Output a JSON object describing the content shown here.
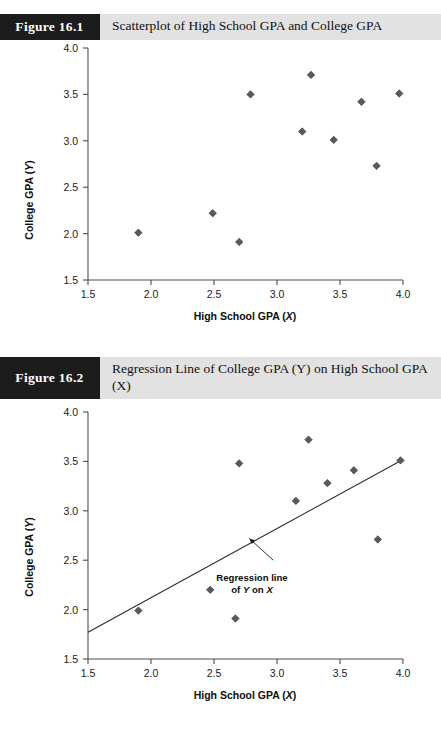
{
  "page": {
    "background": "#ffffff",
    "accent_badge_color": "#1c1c1c",
    "banner_color": "#e2e2e2",
    "marker_color": "#5a5a5a",
    "line_color": "#2a2a2a"
  },
  "figures": [
    {
      "id": "figure-16-1",
      "label": "Figure 16.1",
      "caption": "Scatterplot of High School GPA and College GPA"
    },
    {
      "id": "figure-16-2",
      "label": "Figure 16.2",
      "caption": "Regression Line of College GPA (Y) on High School GPA (X)"
    }
  ],
  "chart_data": [
    {
      "type": "scatter",
      "title": "Scatterplot of High School GPA and College GPA",
      "xlabel": "High School GPA (X)",
      "xlabel_main": "High School GPA (",
      "xlabel_italic": "X",
      "xlabel_tail": ")",
      "ylabel": "College GPA (Y)",
      "ylabel_main": "College GPA (",
      "ylabel_italic": "Y",
      "ylabel_tail": ")",
      "xlim": [
        1.5,
        4.0
      ],
      "ylim": [
        1.5,
        4.0
      ],
      "xticks": [
        "1.5",
        "2.0",
        "2.5",
        "3.0",
        "3.5",
        "4.0"
      ],
      "xtick_values": [
        1.5,
        2.0,
        2.5,
        3.0,
        3.5,
        4.0
      ],
      "yticks": [
        "1.5",
        "2.0",
        "2.5",
        "3.0",
        "3.5",
        "4.0"
      ],
      "ytick_values": [
        1.5,
        2.0,
        2.5,
        3.0,
        3.5,
        4.0
      ],
      "grid": false,
      "legend": false,
      "points": [
        {
          "x": 1.9,
          "y": 2.01
        },
        {
          "x": 2.49,
          "y": 2.22
        },
        {
          "x": 2.7,
          "y": 1.91
        },
        {
          "x": 2.79,
          "y": 3.5
        },
        {
          "x": 3.2,
          "y": 3.1
        },
        {
          "x": 3.27,
          "y": 3.71
        },
        {
          "x": 3.45,
          "y": 3.01
        },
        {
          "x": 3.67,
          "y": 3.42
        },
        {
          "x": 3.79,
          "y": 2.73
        },
        {
          "x": 3.97,
          "y": 3.51
        }
      ]
    },
    {
      "type": "scatter",
      "title": "Regression Line of College GPA (Y) on High School GPA (X)",
      "xlabel": "High School GPA (X)",
      "xlabel_main": "High School GPA (",
      "xlabel_italic": "X",
      "xlabel_tail": ")",
      "ylabel": "College GPA (Y)",
      "ylabel_main": "College GPA (",
      "ylabel_italic": "Y",
      "ylabel_tail": ")",
      "xlim": [
        1.5,
        4.0
      ],
      "ylim": [
        1.5,
        4.0
      ],
      "xticks": [
        "1.5",
        "2.0",
        "2.5",
        "3.0",
        "3.5",
        "4.0"
      ],
      "xtick_values": [
        1.5,
        2.0,
        2.5,
        3.0,
        3.5,
        4.0
      ],
      "yticks": [
        "1.5",
        "2.0",
        "2.5",
        "3.0",
        "3.5",
        "4.0"
      ],
      "ytick_values": [
        1.5,
        2.0,
        2.5,
        3.0,
        3.5,
        4.0
      ],
      "grid": false,
      "legend": false,
      "points": [
        {
          "x": 1.9,
          "y": 1.99
        },
        {
          "x": 2.47,
          "y": 2.2
        },
        {
          "x": 2.67,
          "y": 1.91
        },
        {
          "x": 2.7,
          "y": 3.48
        },
        {
          "x": 3.15,
          "y": 3.1
        },
        {
          "x": 3.25,
          "y": 3.72
        },
        {
          "x": 3.4,
          "y": 3.28
        },
        {
          "x": 3.61,
          "y": 3.41
        },
        {
          "x": 3.8,
          "y": 2.71
        },
        {
          "x": 3.98,
          "y": 3.51
        }
      ],
      "fit_line": {
        "x_start": 1.5,
        "y_start": 1.77,
        "x_end": 4.0,
        "y_end": 3.52
      },
      "annotation": {
        "line1": "Regression line",
        "line2_prefix": "of ",
        "line2_y": "Y",
        "line2_mid": " on ",
        "line2_x": "X",
        "arrow_tip": {
          "x": 2.78,
          "y": 2.72
        },
        "arrow_tail": {
          "x": 2.97,
          "y": 2.5
        }
      }
    }
  ]
}
